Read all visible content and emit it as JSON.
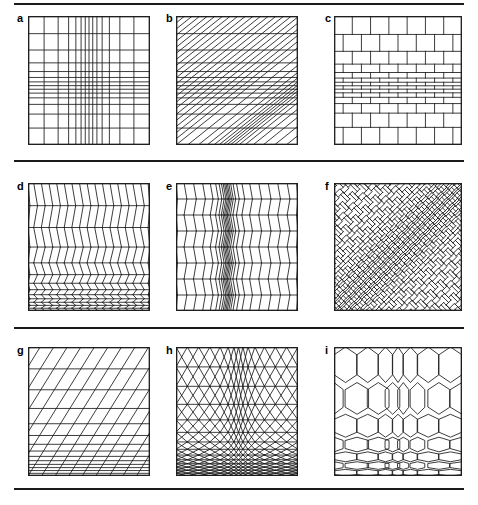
{
  "figure": {
    "width": 478,
    "height": 505,
    "background_color": "#ffffff",
    "line_color": "#1a1a1a",
    "rules": [
      {
        "name": "top-rule",
        "x": 14,
        "y": 3,
        "width": 450,
        "height": 1.6
      },
      {
        "name": "row1-row2-rule",
        "x": 14,
        "y": 160,
        "width": 450,
        "height": 1.6
      },
      {
        "name": "row2-row3-rule",
        "x": 14,
        "y": 327,
        "width": 450,
        "height": 1.6
      },
      {
        "name": "bottom-rule",
        "x": 14,
        "y": 488,
        "width": 450,
        "height": 1.6
      }
    ]
  },
  "panels": [
    {
      "id": "a",
      "label": "a",
      "label_x": 17,
      "label_y": 13,
      "x": 28,
      "y": 16,
      "width": 122,
      "height": 129,
      "pattern": "square-grid",
      "description": "Rectangular square grid with non-uniform spacing; columns compress toward a vertical band near the centre and rows compress toward a horizontal band near the middle.",
      "n_columns": 14,
      "n_rows": 14,
      "compress_x": 0.5,
      "compress_y": 0.55,
      "compress_strength_x": 0.78,
      "compress_strength_y": 0.8,
      "compress_sigma_x": 0.17,
      "compress_sigma_y": 0.16
    },
    {
      "id": "b",
      "label": "b",
      "label_x": 166,
      "label_y": 13,
      "x": 176,
      "y": 16,
      "width": 122,
      "height": 129,
      "pattern": "oblique-grid",
      "description": "Oblique (sheared) grid: horizontal lines with rows compressed near the middle, crossed by steep diagonals rising to the right whose spacing compresses left of centre.",
      "n_columns": 16,
      "n_rows": 14,
      "shear": 1.25,
      "compress_x": 0.42,
      "compress_y": 0.55,
      "compress_strength_x": 0.7,
      "compress_strength_y": 0.8,
      "compress_sigma_x": 0.14,
      "compress_sigma_y": 0.16
    },
    {
      "id": "c",
      "label": "c",
      "label_x": 325,
      "label_y": 13,
      "x": 334,
      "y": 16,
      "width": 128,
      "height": 129,
      "pattern": "running-bond-brick",
      "description": "Running-bond brick tessellation: courses of offset rectangles with the courses strongly compressed toward the middle of the panel.",
      "n_columns": 7,
      "n_rows": 14,
      "offset_fraction": 0.5,
      "compress_y": 0.55,
      "compress_strength_y": 0.82,
      "compress_sigma_y": 0.16
    },
    {
      "id": "d",
      "label": "d",
      "label_x": 17,
      "label_y": 181,
      "x": 28,
      "y": 183,
      "width": 122,
      "height": 128,
      "pattern": "chevron-zigzag",
      "description": "Chevron (zigzag) tessellation: vertical zigzag columns crossed by horizontal course lines; courses compress strongly toward the bottom edge.",
      "n_columns": 16,
      "n_rows": 13,
      "compress_y": 1.0,
      "compress_strength_y": 0.88,
      "compress_sigma_y": 0.3
    },
    {
      "id": "e",
      "label": "e",
      "label_x": 166,
      "label_y": 181,
      "x": 176,
      "y": 183,
      "width": 122,
      "height": 128,
      "pattern": "chevron-zigzag",
      "description": "Chevron (zigzag) tessellation with uniform courses but zigzag columns compressed into a narrow vertical band left of centre.",
      "n_columns": 22,
      "n_rows": 8,
      "compress_x": 0.42,
      "compress_strength_x": 0.86,
      "compress_sigma_x": 0.09
    },
    {
      "id": "f",
      "label": "f",
      "label_x": 325,
      "label_y": 181,
      "x": 334,
      "y": 183,
      "width": 128,
      "height": 128,
      "pattern": "herringbone-diagonal",
      "description": "Herringbone tessellation of interlocking rectangles rotated 45 degrees; the weave compresses along a diagonal band running from upper-left to lower-right.",
      "rotation_deg": 45,
      "n_columns": 26,
      "n_rows": 26,
      "compress_x": 0.5,
      "compress_strength_x": 0.6,
      "compress_sigma_x": 0.13
    },
    {
      "id": "g",
      "label": "g",
      "label_x": 17,
      "label_y": 345,
      "x": 28,
      "y": 347,
      "width": 122,
      "height": 129,
      "pattern": "oblique-grid",
      "description": "Oblique parallelogram grid: horizontal course lines crossed by steep right-leaning diagonals; courses compress heavily toward the bottom edge.",
      "n_columns": 9,
      "n_rows": 14,
      "shear": 0.62,
      "compress_y": 1.0,
      "compress_strength_y": 0.88,
      "compress_sigma_y": 0.32
    },
    {
      "id": "h",
      "label": "h",
      "label_x": 166,
      "label_y": 345,
      "x": 176,
      "y": 347,
      "width": 122,
      "height": 129,
      "pattern": "triangular-lattice",
      "description": "Triangular / diamond lattice formed by two opposing families of diagonals plus horizontal courses; compressed toward the bottom edge and toward a vertical band just right of centre.",
      "n_columns": 14,
      "n_rows": 14,
      "compress_x": 0.52,
      "compress_y": 1.0,
      "compress_strength_x": 0.62,
      "compress_strength_y": 0.86,
      "compress_sigma_x": 0.1,
      "compress_sigma_y": 0.3
    },
    {
      "id": "i",
      "label": "i",
      "label_x": 325,
      "label_y": 345,
      "x": 334,
      "y": 347,
      "width": 128,
      "height": 129,
      "pattern": "hexagonal-lattice",
      "description": "Hexagonal (honeycomb) tessellation with cells compressed toward the bottom edge and toward a vertical band near the centre.",
      "n_columns": 7,
      "n_rows": 7,
      "compress_x": 0.5,
      "compress_y": 1.0,
      "compress_strength_x": 0.55,
      "compress_strength_y": 0.82,
      "compress_sigma_x": 0.11,
      "compress_sigma_y": 0.3
    }
  ]
}
